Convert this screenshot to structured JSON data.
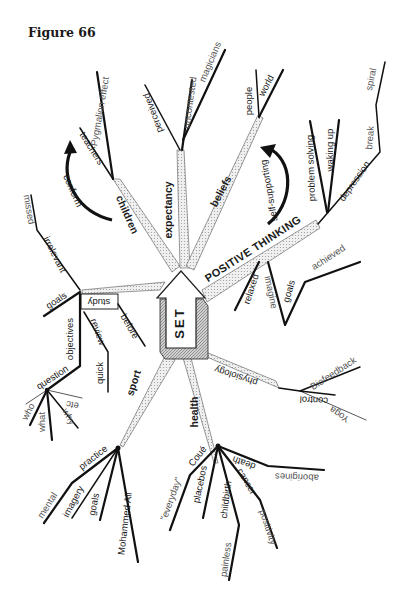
{
  "figure_title": "Figure 66",
  "center": {
    "label": "SET"
  },
  "branches": {
    "expectancy": {
      "label": "expectancy",
      "children": [
        "perceived",
        "uncontested",
        "magicians"
      ]
    },
    "children": {
      "label": "children",
      "children": [
        "teachers",
        "Pygmalion effect"
      ],
      "arrow_label": "conform"
    },
    "beliefs": {
      "label": "beliefs",
      "children": [
        "people",
        "world"
      ],
      "arrow_label": "self-supporting"
    },
    "positive_thinking": {
      "label": "POSITIVE THINKING",
      "children": [
        "problem solving",
        "waking up",
        "depression",
        "break",
        "spiral",
        "relaxed",
        "imagine",
        "goals",
        "achieved"
      ]
    },
    "study": {
      "label": "study",
      "children": [
        "goals",
        "irrelevant",
        "missed",
        "objectives",
        "review",
        "quick",
        "before",
        "question",
        "who",
        "what",
        "why",
        "etc"
      ]
    },
    "sport": {
      "label": "sport",
      "children": [
        "practice",
        "mental",
        "imagery",
        "goals",
        "Mohammed Ali"
      ]
    },
    "health": {
      "label": "health",
      "children": [
        "physiology",
        "control",
        "Biofeedback",
        "Yoga",
        "Coué",
        "\"everyday\"",
        "placebos",
        "childbirth",
        "painless",
        "cancer",
        "positivity",
        "death",
        "aborigines"
      ]
    }
  }
}
